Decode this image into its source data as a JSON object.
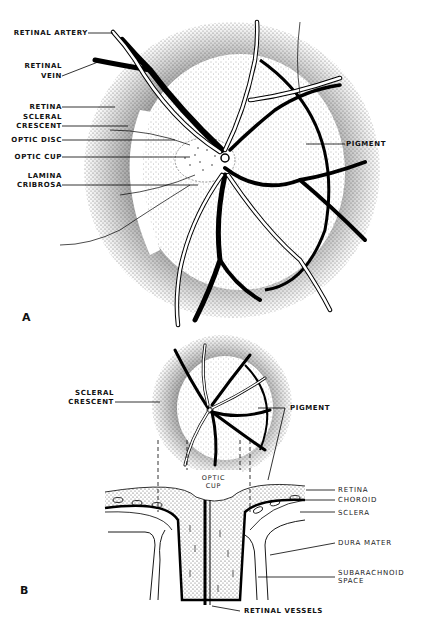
{
  "figure": {
    "panel_a": {
      "panel_label": "A",
      "labels": {
        "retinal_artery": "RETINAL ARTERY",
        "retinal_vein_1": "RETINAL",
        "retinal_vein_2": "VEIN",
        "retina": "RETINA",
        "scleral_crescent_1": "SCLERAL",
        "scleral_crescent_2": "CRESCENT",
        "optic_disc": "OPTIC DISC",
        "optic_cup": "OPTIC CUP",
        "lamina_cribrosa_1": "LAMINA",
        "lamina_cribrosa_2": "CRIBROSA",
        "pigment": "PIGMENT"
      }
    },
    "panel_b": {
      "panel_label": "B",
      "labels": {
        "scleral_crescent_1": "SCLERAL",
        "scleral_crescent_2": "CRESCENT",
        "pigment": "PIGMENT",
        "optic_cup_1": "OPTIC",
        "optic_cup_2": "CUP",
        "retina": "RETINA",
        "choroid": "CHOROID",
        "sclera": "SCLERA",
        "dura_mater": "DURA MATER",
        "subarachnoid_space_1": "SUBARACHNOID",
        "subarachnoid_space_2": "SPACE",
        "retinal_vessels": "RETINAL VESSELS"
      }
    }
  }
}
